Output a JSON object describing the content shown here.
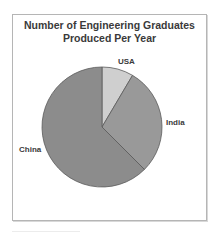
{
  "chart_data": {
    "type": "pie",
    "title": "Number of Engineering Graduates Produced Per Year",
    "title_lines": [
      "Number of Engineering Graduates",
      "Produced Per Year"
    ],
    "categories": [
      "USA",
      "India",
      "China"
    ],
    "values": [
      8.5,
      29,
      62.5
    ],
    "unit": "percent of total (estimated from slice angles)",
    "colors": {
      "USA": "#cfcfcf",
      "India": "#999999",
      "China": "#8c8c8c"
    },
    "legend": "none (data labels outside slices)",
    "start_angle_deg": 0,
    "direction": "clockwise"
  },
  "labels": {
    "usa": "USA",
    "india": "India",
    "china": "China"
  }
}
